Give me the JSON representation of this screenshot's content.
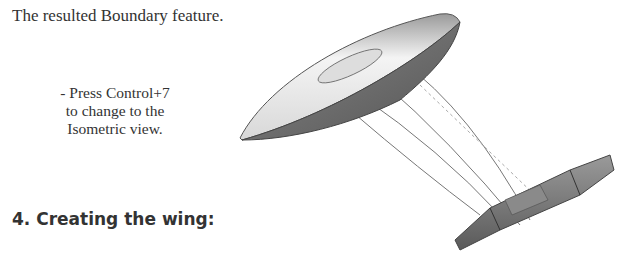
{
  "caption": "The resulted Boundary feature.",
  "instruction": {
    "line1": "- Press Control+7",
    "line2": "to change to the",
    "line3": "Isometric view."
  },
  "section_heading": "4. Creating the wing:",
  "figure": {
    "colors": {
      "body_dark": "#6e6e6e",
      "body_light": "#e6e6e6",
      "curve": "#777777"
    }
  }
}
